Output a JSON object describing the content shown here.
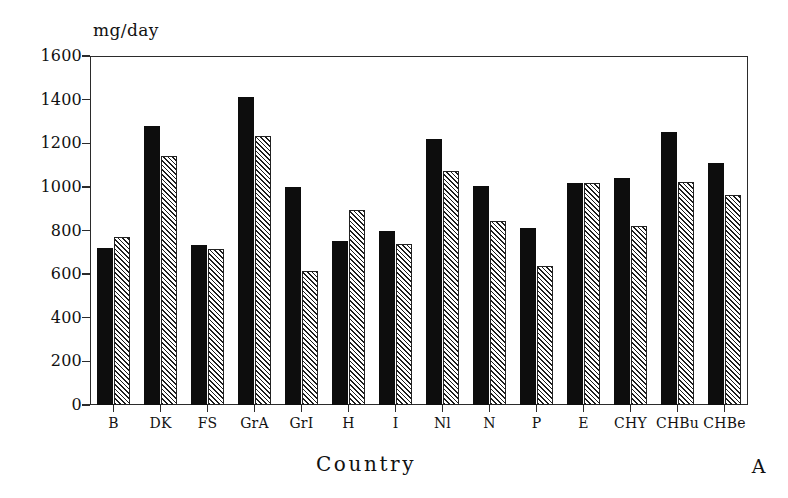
{
  "chart_data": {
    "type": "bar",
    "title": "",
    "subtitle": "",
    "panel_label": "A",
    "xlabel": "Country",
    "ylabel": "mg/day",
    "ylim": [
      0,
      1600
    ],
    "ytick_step": 200,
    "yticks": [
      1600,
      1400,
      1200,
      1000,
      800,
      600,
      400,
      200,
      0
    ],
    "ytick_labels": [
      "1600",
      "1400",
      "1200",
      "1000",
      "800",
      "600",
      "400",
      "200",
      "0"
    ],
    "xtick_labels": [
      "B",
      "DK",
      "FS",
      "GrA",
      "GrI",
      "H",
      "I",
      "Nl",
      "N",
      "P",
      "E",
      "CHY",
      "CHBu",
      "CHBe"
    ],
    "categories": [
      "B",
      "DK",
      "FS",
      "GrA",
      "GrI",
      "H",
      "I",
      "Nl",
      "N",
      "P",
      "E",
      "CHY",
      "CHBu",
      "CHBe"
    ],
    "grid": false,
    "legend": "none",
    "series": [
      {
        "name": "series-1",
        "style": "solid-black",
        "color": "#0d0d0d",
        "values": [
          722,
          1280,
          733,
          1410,
          1000,
          750,
          800,
          1218,
          1002,
          812,
          1018,
          1040,
          1250,
          1108
        ]
      },
      {
        "name": "series-2",
        "style": "hatched",
        "color": "#ffffff",
        "hatch": "diagonal-45",
        "values": [
          770,
          1142,
          716,
          1232,
          614,
          895,
          738,
          1075,
          843,
          638,
          1016,
          822,
          1022,
          962
        ]
      }
    ]
  },
  "axis": {
    "unit_label": "mg/day",
    "x_title": "Country"
  },
  "figure": {
    "panel_letter": "A"
  },
  "colors": {
    "axis": "#2b2b2b",
    "bar_solid": "#0d0d0d",
    "bar_hatch_line": "#1d1d1d",
    "background": "#ffffff"
  }
}
